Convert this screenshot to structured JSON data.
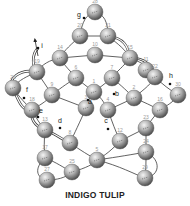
{
  "title": "INDIGO TULIP",
  "colors": {
    "bead_light": "#e8e8e8",
    "bead_mid": "#a8a8a8",
    "bead_dark": "#555555",
    "thread": "#3a3a3a",
    "background": "#ffffff"
  },
  "bead_radius": 8,
  "beads": [
    {
      "id": "28",
      "x": 95,
      "y": 12
    },
    {
      "id": "20",
      "x": 80,
      "y": 36
    },
    {
      "id": "21",
      "x": 108,
      "y": 36
    },
    {
      "id": "14",
      "x": 60,
      "y": 58
    },
    {
      "id": "10",
      "x": 95,
      "y": 55
    },
    {
      "id": "15",
      "x": 130,
      "y": 58
    },
    {
      "id": "19",
      "x": 37,
      "y": 72
    },
    {
      "id": "6",
      "x": 76,
      "y": 78
    },
    {
      "id": "7",
      "x": 112,
      "y": 78
    },
    {
      "id": "11",
      "x": 146,
      "y": 70
    },
    {
      "id": "22",
      "x": 155,
      "y": 77
    },
    {
      "id": "26",
      "x": 13,
      "y": 88
    },
    {
      "id": "9",
      "x": 52,
      "y": 95
    },
    {
      "id": "1",
      "x": 94,
      "y": 92
    },
    {
      "id": "2",
      "x": 134,
      "y": 98
    },
    {
      "id": "30",
      "x": 178,
      "y": 95
    },
    {
      "id": "18",
      "x": 32,
      "y": 110
    },
    {
      "id": "3",
      "x": 86,
      "y": 108
    },
    {
      "id": "4",
      "x": 108,
      "y": 110
    },
    {
      "id": "16",
      "x": 160,
      "y": 110
    },
    {
      "id": "13",
      "x": 45,
      "y": 130
    },
    {
      "id": "8",
      "x": 70,
      "y": 143
    },
    {
      "id": "12",
      "x": 120,
      "y": 141
    },
    {
      "id": "23",
      "x": 146,
      "y": 128
    },
    {
      "id": "5",
      "x": 97,
      "y": 160
    },
    {
      "id": "17",
      "x": 45,
      "y": 158
    },
    {
      "id": "24",
      "x": 146,
      "y": 152
    },
    {
      "id": "25",
      "x": 72,
      "y": 172
    },
    {
      "id": "27",
      "x": 47,
      "y": 180
    },
    {
      "id": "29",
      "x": 145,
      "y": 178
    }
  ],
  "markers": [
    {
      "label": "g",
      "x": 84,
      "y": 18,
      "lx": 79,
      "ly": 17
    },
    {
      "label": "i",
      "x": 38,
      "y": 48,
      "lx": 42,
      "ly": 48
    },
    {
      "label": "f",
      "x": 24,
      "y": 98,
      "lx": 27,
      "ly": 92
    },
    {
      "label": "e",
      "x": 38,
      "y": 117,
      "lx": 41,
      "ly": 113
    },
    {
      "label": "d",
      "x": 60,
      "y": 128,
      "lx": 60,
      "ly": 123
    },
    {
      "label": "c",
      "x": 108,
      "y": 129,
      "lx": 106,
      "ly": 123
    },
    {
      "label": "a",
      "x": 88,
      "y": 100,
      "lx": 90,
      "ly": 104
    },
    {
      "label": "b",
      "x": 114,
      "y": 94,
      "lx": 117,
      "ly": 96
    },
    {
      "label": "h",
      "x": 170,
      "y": 84,
      "lx": 171,
      "ly": 78
    }
  ],
  "arrows": [
    {
      "name": "start-arrow",
      "x1": 38,
      "y1": 56,
      "x2": 35,
      "y2": 40
    }
  ],
  "threads": [
    "M95 12 C86 14 82 22 80 36",
    "M95 12 C104 14 108 22 108 36",
    "M80 36 L108 36",
    "M80 36 C72 44 64 50 60 58",
    "M108 36 C118 44 126 50 130 58",
    "M60 58 L95 55 L130 58",
    "M60 58 C50 60 42 64 37 72",
    "M130 58 C140 62 150 66 155 77",
    "M60 58 C64 66 72 72 76 78",
    "M130 58 C124 66 116 72 112 78",
    "M76 78 L94 92 L112 78",
    "M37 72 C28 76 18 80 13 88",
    "M13 88 C20 98 26 104 32 110",
    "M37 72 C42 80 48 88 52 95",
    "M155 77 C162 84 170 90 178 95",
    "M155 77 C150 86 140 92 134 98",
    "M178 95 C174 102 166 106 160 110",
    "M52 95 C46 102 38 106 32 110",
    "M52 95 L86 108",
    "M134 98 L108 110",
    "M134 98 C144 102 152 106 160 110",
    "M32 110 C36 118 40 124 45 130",
    "M160 110 C154 116 150 122 146 128",
    "M86 108 C80 122 74 134 70 143",
    "M108 110 C112 122 116 132 120 141",
    "M45 130 L70 143",
    "M146 128 L120 141",
    "M45 130 C44 140 44 150 45 158",
    "M146 128 C146 136 146 144 146 152",
    "M70 143 C80 150 90 156 97 160",
    "M120 141 C112 150 104 156 97 160",
    "M45 158 C56 162 64 168 72 172",
    "M146 152 C124 156 110 158 97 160",
    "M72 172 C66 178 56 180 47 180",
    "M146 152 C146 162 146 170 145 178",
    "M72 172 C86 168 94 164 97 160",
    "M97 160 C120 166 134 174 145 178",
    "M47 180 C36 178 34 168 45 158",
    "M145 178 C160 176 162 160 146 152",
    "M94 92 C90 96 88 102 86 108",
    "M94 92 C100 96 104 102 108 110",
    "M76 78 C66 84 58 90 52 95",
    "M112 78 C122 86 128 92 134 98"
  ],
  "double_threads": [
    "M37 72 C30 62 34 52 38 48",
    "M13 88 C6 80 20 68 37 72",
    "M108 36 C124 38 128 46 130 58",
    "M130 58 C146 58 150 64 155 77",
    "M32 110 C22 112 18 100 13 88",
    "M45 130 C34 126 30 118 32 110",
    "M70 143 C60 138 52 132 45 130"
  ]
}
